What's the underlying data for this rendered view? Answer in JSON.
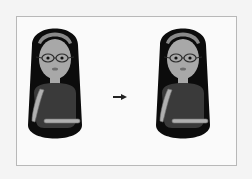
{
  "figure": {
    "left_figure": {
      "label": "before"
    },
    "right_figure": {
      "label": "after"
    },
    "arrow": {
      "icon": "arrow-right-icon"
    },
    "colors": {
      "hair": "#0c0c0c",
      "headband": "#8a8a8a",
      "skin": "#a8a8a8",
      "shirt": "#3a3a3a",
      "arm_band": "#b0b0b0",
      "glasses": "#2a2a2a",
      "mouth": "#6e6e6e",
      "border": "#b8b8b8"
    }
  }
}
